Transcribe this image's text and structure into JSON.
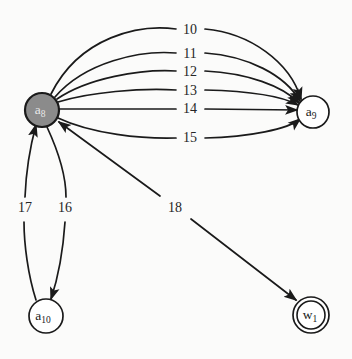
{
  "diagram": {
    "type": "directed-multigraph",
    "background_color": "#fbfbfa",
    "stroke_color": "#1a1a1a",
    "active_node_fill": "#8b8b8b",
    "nodes": [
      {
        "id": "a8",
        "label": "a",
        "subscript": "8",
        "cx": 42,
        "cy": 110,
        "r": 17,
        "style": "filled",
        "accepting": false
      },
      {
        "id": "a9",
        "label": "a",
        "subscript": "9",
        "cx": 313,
        "cy": 112,
        "r": 16,
        "style": "plain",
        "accepting": false
      },
      {
        "id": "a10",
        "label": "a",
        "subscript": "10",
        "cx": 46,
        "cy": 316,
        "r": 17,
        "style": "plain",
        "accepting": false
      },
      {
        "id": "w1",
        "label": "w",
        "subscript": "1",
        "cx": 311,
        "cy": 315,
        "r": 18,
        "style": "double",
        "accepting": true
      }
    ],
    "edges": [
      {
        "id": "e10",
        "label": "10",
        "from": "a8",
        "to": "a9",
        "label_x": 190,
        "label_y": 31
      },
      {
        "id": "e11",
        "label": "11",
        "from": "a8",
        "to": "a9",
        "label_x": 190,
        "label_y": 55
      },
      {
        "id": "e12",
        "label": "12",
        "from": "a8",
        "to": "a9",
        "label_x": 190,
        "label_y": 73
      },
      {
        "id": "e13",
        "label": "13",
        "from": "a8",
        "to": "a9",
        "label_x": 190,
        "label_y": 92
      },
      {
        "id": "e14",
        "label": "14",
        "from": "a8",
        "to": "a9",
        "label_x": 190,
        "label_y": 110
      },
      {
        "id": "e15",
        "label": "15",
        "from": "a8",
        "to": "a9",
        "label_x": 190,
        "label_y": 139
      },
      {
        "id": "e16",
        "label": "16",
        "from": "a8",
        "to": "a10",
        "label_x": 65,
        "label_y": 209
      },
      {
        "id": "e17",
        "label": "17",
        "from": "a10",
        "to": "a8",
        "label_x": 25,
        "label_y": 209
      },
      {
        "id": "e18",
        "label": "18",
        "from": "a8",
        "to": "w1",
        "label_x": 175,
        "label_y": 209
      }
    ]
  }
}
